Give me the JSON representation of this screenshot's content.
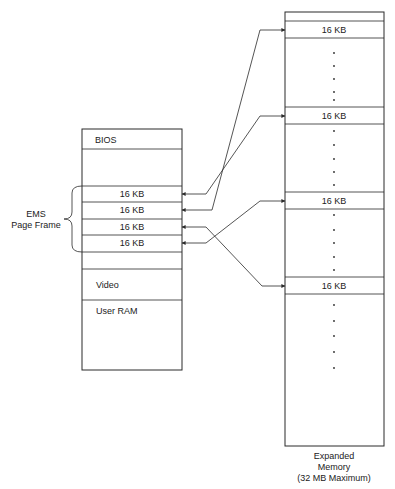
{
  "conventional_memory": {
    "sections": {
      "bios": "BIOS",
      "video": "Video",
      "user_ram": "User RAM"
    },
    "page_frame_slots": [
      "16 KB",
      "16 KB",
      "16 KB",
      "16 KB"
    ],
    "page_frame_label_line1": "EMS",
    "page_frame_label_line2": "Page Frame"
  },
  "expanded_memory": {
    "pages": [
      "16 KB",
      "16 KB",
      "16 KB",
      "16 KB"
    ],
    "caption_line1": "Expanded",
    "caption_line2": "Memory",
    "caption_line3": "(32 MB Maximum)"
  },
  "mappings": [
    {
      "frame_slot": 1,
      "expanded_page": 2
    },
    {
      "frame_slot": 2,
      "expanded_page": 1
    },
    {
      "frame_slot": 3,
      "expanded_page": 4
    },
    {
      "frame_slot": 4,
      "expanded_page": 3
    }
  ],
  "colors": {
    "line": "#2a2a2a",
    "background": "#ffffff"
  }
}
